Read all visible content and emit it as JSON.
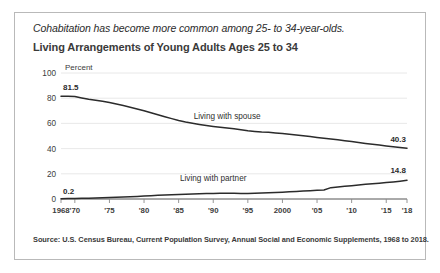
{
  "card": {
    "subtitle": "Cohabitation has become more common among 25- to 34-year-olds.",
    "title": "Living Arrangements of Young Adults Ages 25 to 34",
    "source": "Source: U.S. Census Bureau, Current Population Survey, Annual Social and Economic Supplements, 1968 to 2018."
  },
  "chart_data": {
    "type": "line",
    "title": "Living Arrangements of Young Adults Ages 25 to 34",
    "subtitle": "Cohabitation has become more common among 25- to 34-year-olds.",
    "xlabel": "",
    "ylabel": "Percent",
    "ylim": [
      0,
      100
    ],
    "xlim": [
      1968,
      2018
    ],
    "yticks": [
      0,
      20,
      40,
      60,
      80,
      100
    ],
    "ytick_labels": [
      "0",
      "20",
      "40",
      "60",
      "80",
      "100"
    ],
    "xticks": [
      1968,
      1970,
      1975,
      1980,
      1985,
      1990,
      1995,
      2000,
      2005,
      2010,
      2015,
      2018
    ],
    "xtick_labels": [
      "1968",
      "'70",
      "'75",
      "'80",
      "'85",
      "'90",
      "'95",
      "2000",
      "'05",
      "'10",
      "'15",
      "'18"
    ],
    "grid": true,
    "legend": "inline-labels",
    "annotations": [
      {
        "text": "81.5",
        "series": "Living with spouse",
        "x": 1968,
        "y": 81.5
      },
      {
        "text": "40.3",
        "series": "Living with spouse",
        "x": 2018,
        "y": 40.3
      },
      {
        "text": "0.2",
        "series": "Living with partner",
        "x": 1968,
        "y": 0.2
      },
      {
        "text": "14.8",
        "series": "Living with partner",
        "x": 2018,
        "y": 14.8
      }
    ],
    "x": [
      1968,
      1969,
      1970,
      1971,
      1972,
      1973,
      1974,
      1975,
      1976,
      1977,
      1978,
      1979,
      1980,
      1981,
      1982,
      1983,
      1984,
      1985,
      1986,
      1987,
      1988,
      1989,
      1990,
      1991,
      1992,
      1993,
      1994,
      1995,
      1996,
      1997,
      1998,
      1999,
      2000,
      2001,
      2002,
      2003,
      2004,
      2005,
      2006,
      2007,
      2008,
      2009,
      2010,
      2011,
      2012,
      2013,
      2014,
      2015,
      2016,
      2017,
      2018
    ],
    "series": [
      {
        "name": "Living with spouse",
        "label": "Living with spouse",
        "color": "#2b2b2b",
        "values": [
          81.5,
          81.6,
          81.3,
          80.2,
          79.2,
          78.4,
          77.6,
          76.6,
          75.4,
          74.2,
          72.9,
          71.5,
          70.1,
          68.4,
          66.8,
          65.3,
          63.8,
          62.3,
          61.1,
          60.1,
          59.2,
          58.4,
          57.6,
          56.9,
          56.3,
          55.7,
          55.0,
          54.2,
          53.6,
          53.1,
          52.9,
          52.4,
          51.9,
          51.4,
          50.8,
          50.2,
          49.6,
          48.9,
          48.2,
          47.6,
          47.0,
          46.3,
          45.6,
          44.8,
          44.1,
          43.5,
          42.8,
          42.1,
          41.5,
          40.9,
          40.3
        ]
      },
      {
        "name": "Living with partner",
        "label": "Living with partner",
        "color": "#2b2b2b",
        "values": [
          0.2,
          0.3,
          0.4,
          0.5,
          0.6,
          0.8,
          0.9,
          1.1,
          1.3,
          1.5,
          1.8,
          2.0,
          2.3,
          2.6,
          2.9,
          3.1,
          3.4,
          3.6,
          3.8,
          4.0,
          4.2,
          4.3,
          4.4,
          4.5,
          4.6,
          4.5,
          4.4,
          4.3,
          4.5,
          4.7,
          5.0,
          5.2,
          5.4,
          5.7,
          6.0,
          6.3,
          6.6,
          6.9,
          7.2,
          9.0,
          9.6,
          10.1,
          10.6,
          11.2,
          11.7,
          12.1,
          12.5,
          13.0,
          13.5,
          14.1,
          14.8
        ]
      }
    ]
  }
}
